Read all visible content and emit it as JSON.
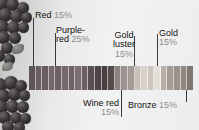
{
  "figure": {
    "kind": "color-proportion-swatch-strip",
    "background_photo": "berry-cluster-photo"
  },
  "callouts": [
    {
      "id": "red",
      "name": "Red",
      "percent": "15%",
      "line_x": 33,
      "line_top": 18,
      "line_bottom": 66
    },
    {
      "id": "purple-red",
      "name": "Purple-\nred",
      "percent": "25%",
      "line_x": 55,
      "line_top": 33,
      "line_bottom": 66
    },
    {
      "id": "gold-luster",
      "name": "Gold\nluster",
      "percent": "15%",
      "line_x": 134,
      "line_top": 36,
      "line_bottom": 66
    },
    {
      "id": "gold",
      "name": "Gold",
      "percent": "15%",
      "line_x": 157,
      "line_top": 34,
      "line_bottom": 66
    },
    {
      "id": "wine-red",
      "name": "Wine red",
      "percent": "15%",
      "line_x": 121,
      "line_top": 90,
      "line_bottom": 117
    },
    {
      "id": "bronze",
      "name": "Bronze",
      "percent": "15%",
      "line_x": 186,
      "line_top": 90,
      "line_bottom": 102
    }
  ],
  "labels": {
    "red": {
      "name": "Red",
      "percent": "15%"
    },
    "purple_red": {
      "line1": "Purple-",
      "line2": "red",
      "percent": "25%"
    },
    "gold_luster": {
      "line1": "Gold",
      "line2": "luster",
      "percent": "15%"
    },
    "gold": {
      "name": "Gold",
      "percent": "15%"
    },
    "wine_red": {
      "name": "Wine red",
      "percent": "15%"
    },
    "bronze": {
      "name": "Bronze",
      "percent": "15%"
    }
  },
  "chart_data": {
    "type": "bar",
    "title": "",
    "xlabel": "",
    "ylabel": "",
    "grid": false,
    "legend_position": "callout-labels",
    "categories": [
      "Red",
      "Purple-red",
      "Wine red",
      "Gold luster",
      "Gold",
      "Bronze"
    ],
    "values": [
      15,
      25,
      15,
      15,
      15,
      15
    ],
    "value_unit": "%",
    "swatch_colors": [
      "#5e5558",
      "#6b5f62",
      "#6a5e60",
      "#746769",
      "#6d6063",
      "#756a6c",
      "#6e6264",
      "#7a6e70",
      "#6c6062",
      "#5a4f52",
      "#4e4447",
      "#48403f",
      "#564c4d",
      "#8c8381",
      "#9c938f",
      "#a59b96",
      "#c8c1bb",
      "#d7d1ca",
      "#cdc6bf",
      "#e3ded7",
      "#b7afa8",
      "#a49b94",
      "#9b928b",
      "#8f8780",
      "#7e766f"
    ],
    "swatch_count": 25
  }
}
